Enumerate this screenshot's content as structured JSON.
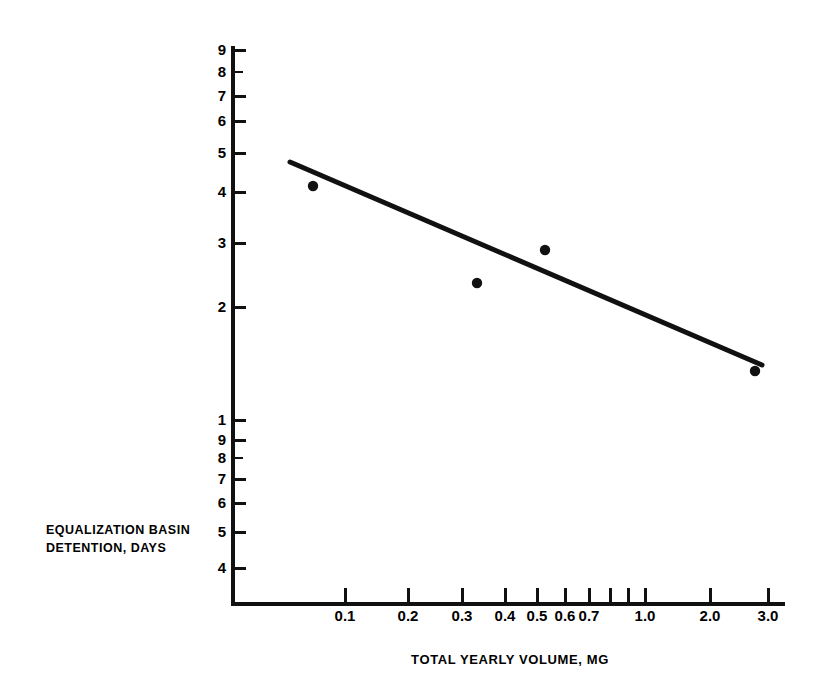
{
  "chart_data": {
    "type": "scatter",
    "title": "",
    "xlabel": "TOTAL YEARLY VOLUME, MG",
    "ylabel_lines": [
      "EQUALIZATION BASIN",
      "DETENTION, DAYS"
    ],
    "ylabel": "EQUALIZATION BASIN DETENTION, DAYS",
    "xscale": "log",
    "yscale": "log",
    "xlim": [
      0.07,
      3.6
    ],
    "ylim": [
      0.37,
      9.6
    ],
    "grid": false,
    "legend": null,
    "x_ticks": [
      {
        "label": "0.1",
        "value": 0.1,
        "px": 345
      },
      {
        "label": "0.2",
        "value": 0.2,
        "px": 408
      },
      {
        "label": "0.3",
        "value": 0.3,
        "px": 462
      },
      {
        "label": "0.4",
        "value": 0.4,
        "px": 505
      },
      {
        "label": "0.5",
        "value": 0.5,
        "px": 537
      },
      {
        "label": "0.6",
        "value": 0.6,
        "px": 565
      },
      {
        "label": "0.7",
        "value": 0.7,
        "px": 589
      },
      {
        "label": "",
        "value": 0.8,
        "px": 610
      },
      {
        "label": "",
        "value": 0.9,
        "px": 628
      },
      {
        "label": "1.0",
        "value": 1.0,
        "px": 645
      },
      {
        "label": "2.0",
        "value": 2.0,
        "px": 710
      },
      {
        "label": "3.0",
        "value": 3.0,
        "px": 768
      }
    ],
    "y_ticks": [
      {
        "label": "9",
        "value": 9,
        "px": 50
      },
      {
        "label": "8",
        "value": 8,
        "px": 72
      },
      {
        "label": "7",
        "value": 7,
        "px": 96
      },
      {
        "label": "6",
        "value": 6,
        "px": 121
      },
      {
        "label": "5",
        "value": 5,
        "px": 153
      },
      {
        "label": "4",
        "value": 4,
        "px": 192
      },
      {
        "label": "3",
        "value": 3,
        "px": 243
      },
      {
        "label": "2",
        "value": 2,
        "px": 307
      },
      {
        "label": "1",
        "value": 1,
        "px": 420
      },
      {
        "label": "9",
        "value": 0.9,
        "px": 440
      },
      {
        "label": "8",
        "value": 0.8,
        "px": 458
      },
      {
        "label": "7",
        "value": 0.7,
        "px": 479
      },
      {
        "label": "6",
        "value": 0.6,
        "px": 503
      },
      {
        "label": "5",
        "value": 0.5,
        "px": 532
      },
      {
        "label": "4",
        "value": 0.4,
        "px": 568
      }
    ],
    "series": [
      {
        "name": "Observed plants",
        "marker": "filled-circle",
        "color": "#111111",
        "points": [
          {
            "x": 0.075,
            "y": 4.2,
            "px": 313,
            "py": 186
          },
          {
            "x": 0.36,
            "y": 2.4,
            "px": 477,
            "py": 283
          },
          {
            "x": 0.6,
            "y": 2.9,
            "px": 545,
            "py": 250
          },
          {
            "x": 2.75,
            "y": 1.25,
            "px": 755,
            "py": 371
          }
        ]
      }
    ],
    "trend_line": {
      "name": "Best-fit regression line",
      "color": "#111111",
      "width_px": 5,
      "start": {
        "x": 0.065,
        "y": 4.7,
        "px": 290,
        "py": 162
      },
      "end": {
        "x": 2.95,
        "y": 1.3,
        "px": 762,
        "py": 365
      }
    },
    "colors": {
      "ink": "#111111",
      "background": "#ffffff"
    }
  }
}
